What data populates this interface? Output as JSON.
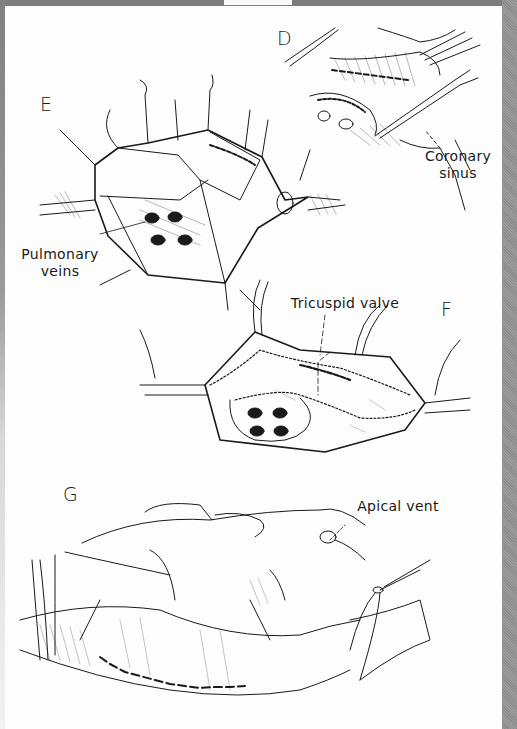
{
  "page": {
    "type": "scanned textbook figure page",
    "colors": {
      "frame": "#8a8a8a",
      "paper": "#fdfdfd",
      "ink": "#1a1a1a"
    }
  },
  "panels": [
    {
      "id": "D",
      "letter": "D",
      "labels": [
        {
          "line1": "Coronary",
          "line2": "sinus"
        }
      ]
    },
    {
      "id": "E",
      "letter": "E",
      "labels": [
        {
          "line1": "Pulmonary",
          "line2": "veins"
        }
      ]
    },
    {
      "id": "F",
      "letter": "F",
      "labels": [
        {
          "line1": "Tricuspid valve"
        }
      ]
    },
    {
      "id": "G",
      "letter": "G",
      "labels": [
        {
          "line1": "Apical vent"
        }
      ]
    }
  ]
}
